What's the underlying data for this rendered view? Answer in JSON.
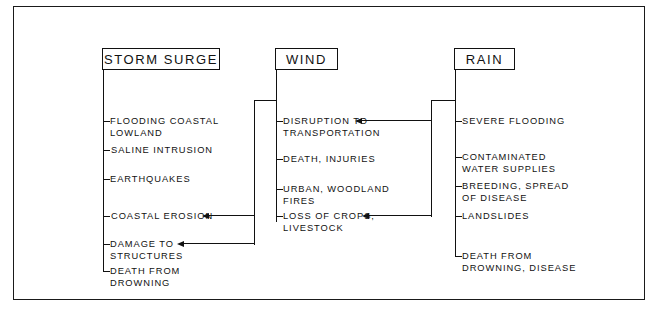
{
  "diagram": {
    "frame_color": "#111111",
    "background": "#ffffff",
    "columns": [
      {
        "id": "storm-surge",
        "header": "STORM SURGE",
        "items": [
          "FLOODING COASTAL\nLOWLAND",
          "SALINE  INTRUSION",
          "EARTHQUAKES",
          "COASTAL EROSION",
          "DAMAGE TO\nSTRUCTURES",
          "DEATH FROM\nDROWNING"
        ]
      },
      {
        "id": "wind",
        "header": "WIND",
        "items": [
          "DISRUPTION TO\nTRANSPORTATION",
          "DEATH, INJURIES",
          "URBAN, WOODLAND\nFIRES",
          "LOSS OF CROPS,\nLIVESTOCK"
        ]
      },
      {
        "id": "rain",
        "header": "RAIN",
        "items": [
          "SEVERE FLOODING",
          "CONTAMINATED\nWATER SUPPLIES",
          "BREEDING, SPREAD\nOF DISEASE",
          "LANDSLIDES",
          "DEATH FROM\nDROWNING, DISEASE"
        ]
      }
    ],
    "connectors": [
      {
        "from": "wind",
        "to": "storm-surge.COASTAL EROSION",
        "arrow": "left"
      },
      {
        "from": "wind",
        "to": "storm-surge.DAMAGE TO STRUCTURES",
        "arrow": "left"
      },
      {
        "from": "rain",
        "to": "wind.DISRUPTION TO TRANSPORTATION",
        "arrow": "left"
      },
      {
        "from": "rain",
        "to": "wind.LOSS OF CROPS, LIVESTOCK",
        "arrow": "left"
      }
    ]
  }
}
